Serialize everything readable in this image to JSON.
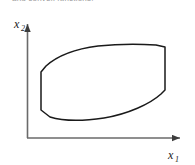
{
  "figure": {
    "caption_fragment": "and convex functions.",
    "background_color": "#ffffff",
    "stroke_color": "#1a1a1a",
    "axis_color": "#555555",
    "width": 195,
    "height": 165
  },
  "axes": {
    "x_axis": {
      "label": "x",
      "subscript": "1",
      "name": "x1-axis",
      "arrow": "right-arrow",
      "origin_x": 27,
      "origin_y": 138,
      "end_x": 185,
      "end_y": 138
    },
    "y_axis": {
      "label": "x",
      "subscript": "2",
      "name": "x2-axis",
      "arrow": "up-arrow",
      "origin_x": 27,
      "origin_y": 138,
      "end_x": 27,
      "end_y": 20
    }
  },
  "chart_data": {
    "type": "line",
    "title": "",
    "xlabel": "x1",
    "ylabel": "x2",
    "grid": false,
    "legend": "none",
    "region": {
      "name": "convex-set-region",
      "description": "Closed convex region: lens/eye shaped outline with flat vertical segments on the left and right sides, curved top and bottom arcs.",
      "filled": false,
      "closed": true,
      "path": "M 41 72 L 41 110 L 50 117 C 66 122 84 121 104 118 C 128 114 150 104 161 94 L 165 90 L 165 47 L 156 45 C 138 44 118 44 98 46 C 74 49 56 57 46 66 Z",
      "vertices": [
        [
          41,
          72
        ],
        [
          41,
          110
        ],
        [
          50,
          117
        ],
        [
          104,
          118
        ],
        [
          161,
          94
        ],
        [
          165,
          90
        ],
        [
          165,
          47
        ],
        [
          156,
          45
        ],
        [
          98,
          46
        ],
        [
          46,
          66
        ]
      ],
      "bounds": {
        "x_min": 41,
        "x_max": 165,
        "y_min": 44,
        "y_max": 121
      }
    }
  }
}
